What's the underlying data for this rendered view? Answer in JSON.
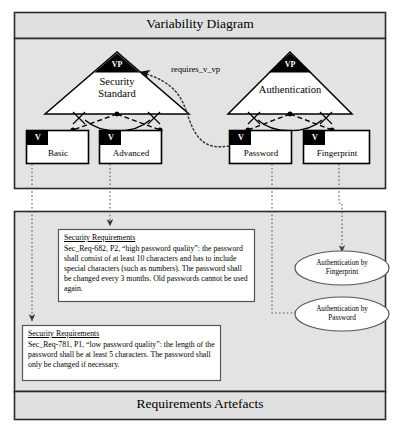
{
  "diagram": {
    "type": "variability-diagram",
    "top_panel_title": "Variability Diagram",
    "bottom_panel_title": "Requirements Artefacts",
    "variation_points": [
      {
        "id": "vp-security-standard",
        "badge": "VP",
        "name_line1": "Security",
        "name_line2": "Standard"
      },
      {
        "id": "vp-authentication",
        "badge": "VP",
        "name_line1": "Authentication",
        "name_line2": ""
      }
    ],
    "variants": [
      {
        "id": "v-basic",
        "badge": "V",
        "label": "Basic"
      },
      {
        "id": "v-advanced",
        "badge": "V",
        "label": "Advanced"
      },
      {
        "id": "v-password",
        "badge": "V",
        "label": "Password"
      },
      {
        "id": "v-fingerprint",
        "badge": "V",
        "label": "Fingerprint"
      }
    ],
    "relations": [
      {
        "id": "requires-v-vp",
        "label": "requires_v_vp",
        "from": "v-password",
        "to": "vp-security-standard"
      }
    ],
    "requirement_boxes": [
      {
        "id": "sec-req-682",
        "heading": "Security Requirements",
        "body": "Sec_Req-682, P2, “high password quality”: the password shall consist of at least 10 characters and has to include special characters (such as numbers). The password shall be changed every 3 months. Old passwords cannot be used again."
      },
      {
        "id": "sec-req-781",
        "heading": "Security Requirements",
        "body": "Sec_Req-781, P1, “low password quality”: the length of the password shall be at least 5 characters. The password shall only be changed if necessary."
      }
    ],
    "artefact_ellipses": [
      {
        "id": "ellipse-fingerprint",
        "line1": "Authentication by",
        "line2": "Fingerprint"
      },
      {
        "id": "ellipse-password",
        "line1": "Authentication by",
        "line2": "Password"
      }
    ],
    "colors": {
      "panel_fill": "#e3e3e3",
      "header_fill": "#e0e0e0",
      "node_fill": "#ffffff",
      "badge_fill": "#000000",
      "stroke": "#000000",
      "page_bg": "#ffffff"
    }
  }
}
